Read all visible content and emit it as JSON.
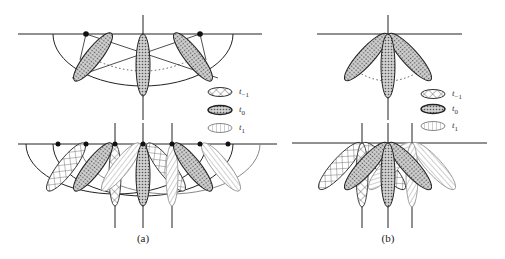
{
  "figure": {
    "panels": [
      {
        "id": "a",
        "caption": "(a)"
      },
      {
        "id": "b",
        "caption": "(b)"
      }
    ],
    "legend": [
      {
        "pattern": "crosshatch",
        "symbol": "t",
        "subscript": "−1"
      },
      {
        "pattern": "dotted-fill",
        "symbol": "t",
        "subscript": "0"
      },
      {
        "pattern": "vertical-stripes",
        "symbol": "t",
        "subscript": "1"
      }
    ],
    "colors": {
      "stroke": "#222222",
      "fill_t0": "#b8b8b8",
      "background": "#ffffff"
    }
  }
}
